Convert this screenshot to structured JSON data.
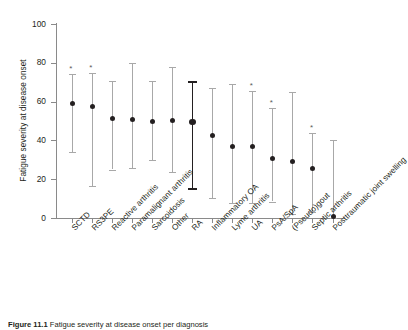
{
  "figure": {
    "ylabel": "Fatigue severity at disease onset",
    "caption_prefix": "Figure",
    "caption_number": "11.1",
    "caption_text": "Fatigue severity at disease onset per diagnosis"
  },
  "chart_data": {
    "type": "scatter",
    "title": "",
    "xlabel": "",
    "ylabel": "Fatigue severity at disease onset",
    "ylim": [
      0,
      100
    ],
    "yticks": [
      0,
      20,
      40,
      60,
      80,
      100
    ],
    "ytick_labels": [
      "0",
      "20",
      "40",
      "60",
      "80",
      "100"
    ],
    "grid": false,
    "legend": "none",
    "error_bar_style": "range",
    "reference_category": "RA",
    "significance_marker": "*",
    "categories": [
      "SCTD",
      "RS3PE",
      "Reactive arthritis",
      "Paramalignant arthritis",
      "Sarcoidosis",
      "Other",
      "RA",
      "Inflammatory OA",
      "Lyme arthritis",
      "UA",
      "PsA/SpA",
      "(Pseudo)gout",
      "Septic arthritis",
      "Posttraumatic joint swelling"
    ],
    "points": [
      {
        "category": "SCTD",
        "value": 59.0,
        "low": 34.0,
        "high": 74.0,
        "significant": true,
        "highlight": false
      },
      {
        "category": "RS3PE",
        "value": 57.5,
        "low": 16.5,
        "high": 75.0,
        "significant": true,
        "highlight": false
      },
      {
        "category": "Reactive arthritis",
        "value": 51.5,
        "low": 25.0,
        "high": 70.5,
        "significant": false,
        "highlight": false
      },
      {
        "category": "Paramalignant arthritis",
        "value": 51.0,
        "low": 26.0,
        "high": 80.0,
        "significant": false,
        "highlight": false
      },
      {
        "category": "Sarcoidosis",
        "value": 50.0,
        "low": 30.0,
        "high": 70.5,
        "significant": false,
        "highlight": false
      },
      {
        "category": "Other",
        "value": 50.5,
        "low": 23.5,
        "high": 78.0,
        "significant": false,
        "highlight": false
      },
      {
        "category": "RA",
        "value": 49.5,
        "low": 15.5,
        "high": 70.5,
        "significant": false,
        "highlight": true
      },
      {
        "category": "Inflammatory OA",
        "value": 42.5,
        "low": 10.5,
        "high": 67.0,
        "significant": false,
        "highlight": false
      },
      {
        "category": "Lyme arthritis",
        "value": 37.0,
        "low": 7.5,
        "high": 69.0,
        "significant": false,
        "highlight": false
      },
      {
        "category": "UA",
        "value": 37.0,
        "low": 7.5,
        "high": 65.5,
        "significant": true,
        "highlight": false
      },
      {
        "category": "PsA/SpA",
        "value": 30.5,
        "low": 8.5,
        "high": 56.5,
        "significant": true,
        "highlight": false
      },
      {
        "category": "(Pseudo)gout",
        "value": 29.0,
        "low": 2.0,
        "high": 65.0,
        "significant": false,
        "highlight": false
      },
      {
        "category": "Septic arthritis",
        "value": 25.5,
        "low": 3.0,
        "high": 44.0,
        "significant": true,
        "highlight": false
      },
      {
        "category": "Posttraumatic joint swelling",
        "value": 1.0,
        "low": 0.0,
        "high": 40.0,
        "significant": false,
        "highlight": false
      }
    ]
  }
}
